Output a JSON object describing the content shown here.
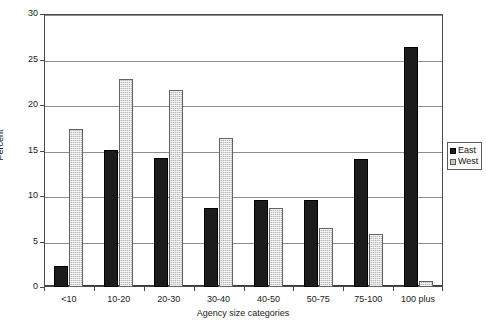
{
  "chart_data": {
    "type": "bar",
    "title": "",
    "xlabel": "Agency size categories",
    "ylabel": "Percent",
    "categories": [
      "<10",
      "10-20",
      "20-30",
      "30-40",
      "40-50",
      "50-75",
      "75-100",
      "100 plus"
    ],
    "series": [
      {
        "name": "East",
        "color": "#1c1c1c",
        "values": [
          2.3,
          15.1,
          14.2,
          8.7,
          9.6,
          9.6,
          14.1,
          26.4
        ]
      },
      {
        "name": "West",
        "color": "#b7b7b7",
        "values": [
          17.4,
          22.9,
          21.6,
          16.4,
          8.7,
          6.5,
          5.8,
          0.7
        ]
      }
    ],
    "ylim": [
      0,
      30
    ],
    "ytick_values": [
      0,
      5,
      10,
      15,
      20,
      25,
      30
    ],
    "ytick_labels": [
      "0",
      "5",
      "10",
      "15",
      "20",
      "25",
      "30"
    ],
    "grid": true,
    "grid_axis": "y",
    "legend_position": "right-outside",
    "legend_entries": [
      "East",
      "West"
    ]
  }
}
